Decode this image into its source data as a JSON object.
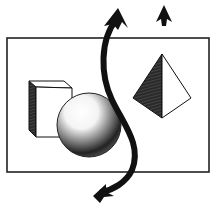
{
  "diagram": {
    "frame": {
      "x": 6,
      "y": 38,
      "width": 203,
      "height": 134,
      "stroke": "#222222"
    },
    "shapes": [
      {
        "id": "cube",
        "label": "cube"
      },
      {
        "id": "sphere",
        "label": "sphere"
      },
      {
        "id": "pyramid",
        "label": "pyramid"
      }
    ],
    "arrows": [
      {
        "id": "curved-double-arrow",
        "direction": "up-and-down-left"
      },
      {
        "id": "up-arrow",
        "direction": "up"
      }
    ],
    "colors": {
      "ink": "#111111",
      "paper": "#ffffff",
      "shade": "#333333"
    }
  }
}
